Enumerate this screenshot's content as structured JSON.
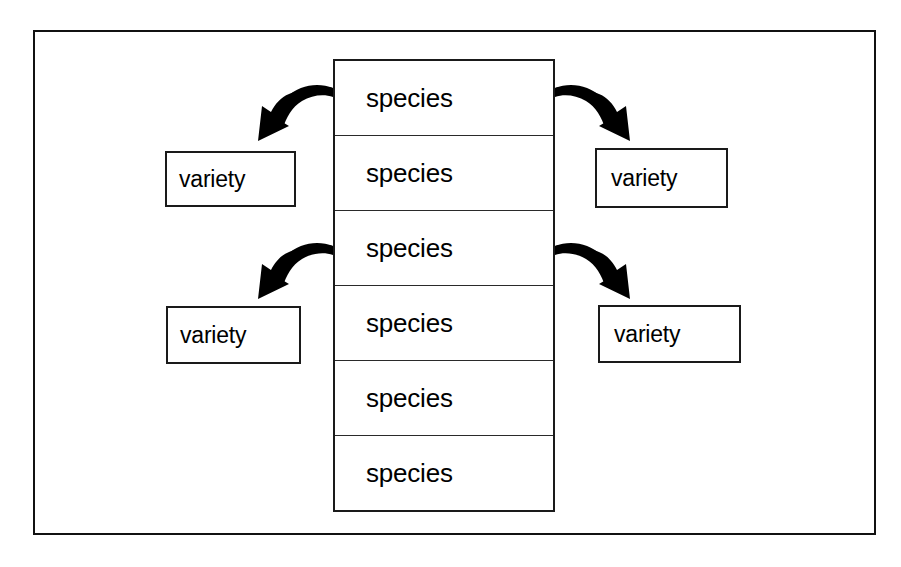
{
  "diagram": {
    "background_color": "#ffffff",
    "line_color": "#111111",
    "arrow_color": "#000000",
    "frame": {
      "name": "outer-frame",
      "border_color": "#111111"
    },
    "species_column": {
      "name": "species-column",
      "cells": [
        {
          "label": "species"
        },
        {
          "label": "species"
        },
        {
          "label": "species"
        },
        {
          "label": "species"
        },
        {
          "label": "species"
        },
        {
          "label": "species"
        }
      ]
    },
    "variety_boxes": [
      {
        "id": "variety-top-left",
        "label": "variety",
        "position": "top-left"
      },
      {
        "id": "variety-top-right",
        "label": "variety",
        "position": "top-right"
      },
      {
        "id": "variety-bottom-left",
        "label": "variety",
        "position": "bottom-left"
      },
      {
        "id": "variety-bottom-right",
        "label": "variety",
        "position": "bottom-right"
      }
    ],
    "arrows": [
      {
        "id": "arrow-top-left",
        "from": "species-cell-1",
        "to": "variety-top-left",
        "direction": "down-left"
      },
      {
        "id": "arrow-top-right",
        "from": "species-cell-1",
        "to": "variety-top-right",
        "direction": "down-right"
      },
      {
        "id": "arrow-bottom-left",
        "from": "species-cell-3",
        "to": "variety-bottom-left",
        "direction": "down-left"
      },
      {
        "id": "arrow-bottom-right",
        "from": "species-cell-3",
        "to": "variety-bottom-right",
        "direction": "down-right"
      }
    ]
  }
}
